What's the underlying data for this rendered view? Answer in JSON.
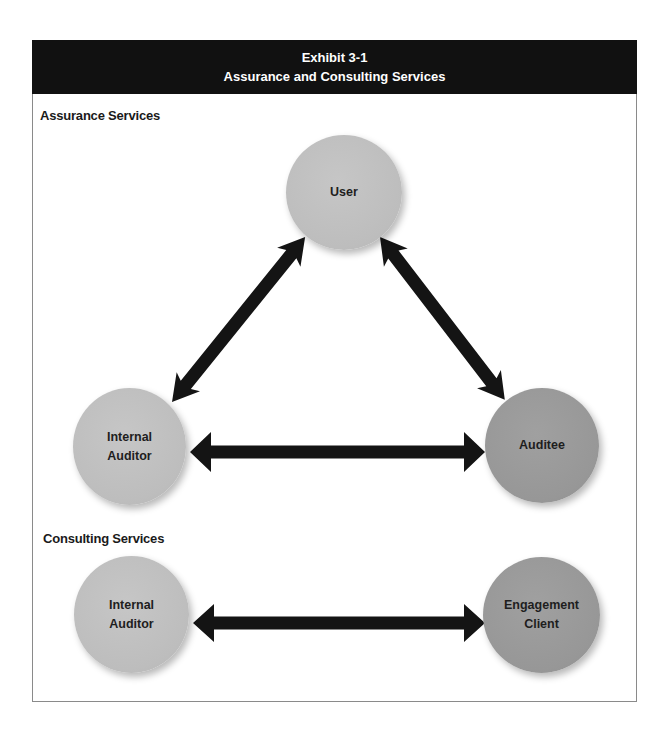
{
  "header": {
    "exhibit": "Exhibit 3-1",
    "title": "Assurance and Consulting Services"
  },
  "sections": {
    "assurance": {
      "label": "Assurance Services",
      "nodes": {
        "user": {
          "lines": [
            "User"
          ],
          "shade": "light"
        },
        "internal_auditor": {
          "lines": [
            "Internal",
            "Auditor"
          ],
          "shade": "light"
        },
        "auditee": {
          "lines": [
            "Auditee"
          ],
          "shade": "dark"
        }
      },
      "relationships": [
        {
          "from": "Internal Auditor",
          "to": "User",
          "type": "bidirectional"
        },
        {
          "from": "User",
          "to": "Auditee",
          "type": "bidirectional"
        },
        {
          "from": "Internal Auditor",
          "to": "Auditee",
          "type": "bidirectional"
        }
      ]
    },
    "consulting": {
      "label": "Consulting Services",
      "nodes": {
        "internal_auditor": {
          "lines": [
            "Internal",
            "Auditor"
          ],
          "shade": "light"
        },
        "engagement_client": {
          "lines": [
            "Engagement",
            "Client"
          ],
          "shade": "dark"
        }
      },
      "relationships": [
        {
          "from": "Internal Auditor",
          "to": "Engagement Client",
          "type": "bidirectional"
        }
      ]
    }
  },
  "colors": {
    "header_bg": "#111111",
    "header_text": "#ffffff",
    "node_light": "#bfbfbf",
    "node_dark": "#979797",
    "arrow": "#141414",
    "frame_border": "#8a8a8a"
  }
}
